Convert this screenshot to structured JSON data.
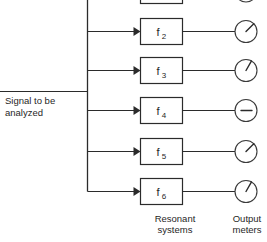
{
  "figure": {
    "input_label_line1": "Signal to be",
    "input_label_line2": "analyzed",
    "column_caption_filters_line1": "Resonant",
    "column_caption_filters_line2": "systems",
    "column_caption_meters_line1": "Output",
    "column_caption_meters_line2": "meters",
    "line_color": "#2b2b2b",
    "background_color": "#ffffff"
  },
  "channels": [
    {
      "id": "f1",
      "filter_label": "f",
      "filter_subscript": "1",
      "meter_name": "output-meter-1",
      "meter_needle_degrees": -45,
      "clipped_top": true
    },
    {
      "id": "f2",
      "filter_label": "f",
      "filter_subscript": "2",
      "meter_name": "output-meter-2",
      "meter_needle_degrees": -45,
      "clipped_top": false
    },
    {
      "id": "f3",
      "filter_label": "f",
      "filter_subscript": "3",
      "meter_name": "output-meter-3",
      "meter_needle_degrees": -60,
      "clipped_top": false
    },
    {
      "id": "f4",
      "filter_label": "f",
      "filter_subscript": "4",
      "meter_name": "output-meter-4",
      "meter_needle_degrees": 0,
      "clipped_top": false
    },
    {
      "id": "f5",
      "filter_label": "f",
      "filter_subscript": "5",
      "meter_name": "output-meter-5",
      "meter_needle_degrees": -45,
      "clipped_top": false
    },
    {
      "id": "f6",
      "filter_label": "f",
      "filter_subscript": "6",
      "meter_name": "output-meter-6",
      "meter_needle_degrees": -60,
      "clipped_top": false
    }
  ]
}
